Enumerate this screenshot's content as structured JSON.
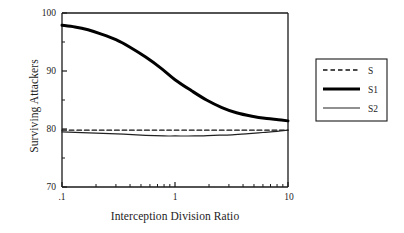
{
  "chart_data": {
    "type": "line",
    "title": "",
    "xlabel": "Interception Division Ratio",
    "ylabel": "Surviving Attackers",
    "xscale": "log",
    "xlim": [
      0.1,
      10
    ],
    "ylim": [
      70,
      100
    ],
    "grid": false,
    "legend_position": "right-outside",
    "xticks_major": [
      ".1",
      "1",
      "10"
    ],
    "xtick_values": [
      0.1,
      1,
      10
    ],
    "xticks_minor": [
      0.2,
      0.3,
      0.4,
      0.5,
      0.6,
      0.7,
      0.8,
      0.9,
      2,
      3,
      4,
      5,
      6,
      7,
      8,
      9
    ],
    "yticks_major": [
      "70",
      "80",
      "90",
      "100"
    ],
    "ytick_values": [
      70,
      80,
      90,
      100
    ],
    "yticks_minor": [
      75,
      85,
      95
    ],
    "series": [
      {
        "name": "S",
        "style": "dashed",
        "width": 1.4,
        "color": "#111111",
        "x": [
          0.1,
          0.2,
          0.4,
          0.7,
          1,
          2,
          4,
          7,
          10
        ],
        "values": [
          79.8,
          79.8,
          79.8,
          79.8,
          79.8,
          79.8,
          79.8,
          79.8,
          79.8
        ]
      },
      {
        "name": "S1",
        "style": "solid-thick",
        "width": 3.0,
        "color": "#000000",
        "x": [
          0.1,
          0.13,
          0.17,
          0.22,
          0.3,
          0.4,
          0.55,
          0.75,
          1.0,
          1.4,
          1.9,
          2.6,
          3.5,
          4.8,
          6.5,
          8.2,
          10
        ],
        "values": [
          97.9,
          97.6,
          97.1,
          96.4,
          95.4,
          94.1,
          92.4,
          90.5,
          88.5,
          86.6,
          85.0,
          83.7,
          82.8,
          82.2,
          81.8,
          81.6,
          81.4
        ]
      },
      {
        "name": "S2",
        "style": "solid-thin",
        "width": 1.2,
        "color": "#222222",
        "x": [
          0.1,
          0.2,
          0.35,
          0.55,
          0.8,
          1.0,
          1.5,
          2.2,
          3.2,
          4.5,
          6.0,
          8.0,
          10
        ],
        "values": [
          79.5,
          79.3,
          79.1,
          78.9,
          78.8,
          78.8,
          78.8,
          78.9,
          79.0,
          79.2,
          79.4,
          79.6,
          79.8
        ]
      }
    ]
  },
  "axes": {
    "y_title": "Surviving Attackers",
    "x_title": "Interception Division Ratio",
    "y_tick_100": "100",
    "y_tick_90": "90",
    "y_tick_80": "80",
    "y_tick_70": "70",
    "x_tick_left": ".1",
    "x_tick_mid": "1",
    "x_tick_right": "10"
  },
  "legend": {
    "entries": [
      {
        "label": "S",
        "style": "dashed"
      },
      {
        "label": "S1",
        "style": "solid-thick"
      },
      {
        "label": "S2",
        "style": "solid-thin"
      }
    ]
  },
  "colors": {
    "axis": "#1a1a1a",
    "series_primary": "#000000",
    "background": "#ffffff"
  }
}
